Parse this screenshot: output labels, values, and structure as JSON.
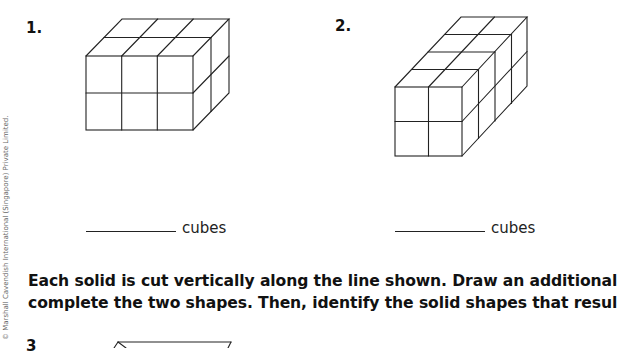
{
  "worksheet": {
    "questions": [
      {
        "number": "1.",
        "answer_blank": "",
        "unit": "cubes",
        "solid": {
          "front_columns": 3,
          "front_rows": 2,
          "depth": 2
        }
      },
      {
        "number": "2.",
        "answer_blank": "",
        "unit": "cubes",
        "solid": {
          "front_columns": 2,
          "front_rows": 2,
          "depth": 4
        }
      },
      {
        "number": "3"
      }
    ],
    "instruction_lines": [
      "Each solid is cut vertically along the line shown. Draw an additional",
      "complete the two shapes. Then, identify the solid shapes that resul"
    ],
    "copyright": "© Marshall Cavendish International (Singapore) Private Limited."
  }
}
